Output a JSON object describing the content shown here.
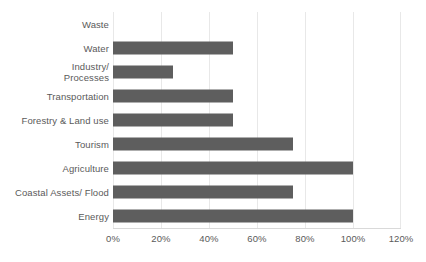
{
  "chart_data": {
    "type": "bar",
    "orientation": "horizontal",
    "title": "",
    "xlabel": "",
    "ylabel": "",
    "xlim": [
      0,
      120
    ],
    "xticks": [
      "0%",
      "20%",
      "40%",
      "60%",
      "80%",
      "100%",
      "120%"
    ],
    "xtick_values": [
      0,
      20,
      40,
      60,
      80,
      100,
      120
    ],
    "grid": true,
    "legend": "none",
    "value_unit": "%",
    "bar_color": "#5e5e5e",
    "gridline_color": "#e8e8e8",
    "text_color": "#5a5a5a",
    "categories": [
      "Waste",
      "Water",
      "Industry/\nProcesses",
      "Transportation",
      "Forestry & Land use",
      "Tourism",
      "Agriculture",
      "Coastal Assets/ Flood",
      "Energy"
    ],
    "values": [
      0,
      50,
      25,
      50,
      50,
      75,
      100,
      75,
      100
    ],
    "series": [
      {
        "name": "",
        "values": [
          0,
          50,
          25,
          50,
          50,
          75,
          100,
          75,
          100
        ]
      }
    ]
  }
}
